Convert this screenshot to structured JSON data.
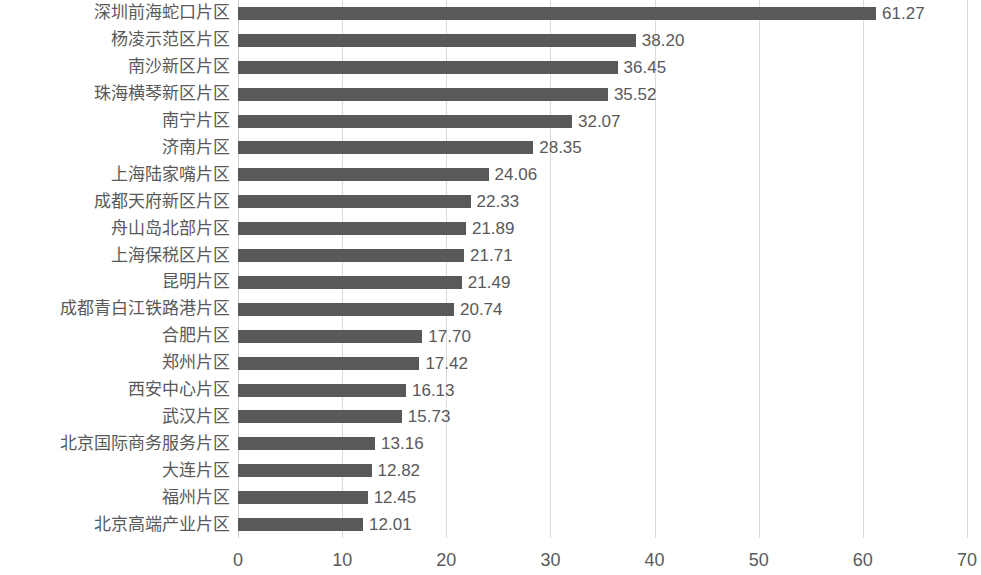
{
  "chart_data": {
    "type": "bar",
    "orientation": "horizontal",
    "title": "",
    "subtitle": "",
    "xlabel": "",
    "ylabel": "",
    "xlim": [
      0,
      70
    ],
    "xticks": [
      "0",
      "10",
      "20",
      "30",
      "40",
      "50",
      "60",
      "70"
    ],
    "grid": "vertical",
    "legend": "none",
    "bar_color": "#595959",
    "gridline_color": "#d9d9d9",
    "text_color": "#595959",
    "background_color": "#ffffff",
    "categories": [
      "深圳前海蛇口片区",
      "杨凌示范区片区",
      "南沙新区片区",
      "珠海横琴新区片区",
      "南宁片区",
      "济南片区",
      "上海陆家嘴片区",
      "成都天府新区片区",
      "舟山岛北部片区",
      "上海保税区片区",
      "昆明片区",
      "成都青白江铁路港片区",
      "合肥片区",
      "郑州片区",
      "西安中心片区",
      "武汉片区",
      "北京国际商务服务片区",
      "大连片区",
      "福州片区",
      "北京高端产业片区"
    ],
    "values": [
      61.27,
      38.2,
      36.45,
      35.52,
      32.07,
      28.35,
      24.06,
      22.33,
      21.89,
      21.71,
      21.49,
      20.74,
      17.7,
      17.42,
      16.13,
      15.73,
      13.16,
      12.82,
      12.45,
      12.01
    ],
    "value_labels": [
      "61.27",
      "38.20",
      "36.45",
      "35.52",
      "32.07",
      "28.35",
      "24.06",
      "22.33",
      "21.89",
      "21.71",
      "21.49",
      "20.74",
      "17.70",
      "17.42",
      "16.13",
      "15.73",
      "13.16",
      "12.82",
      "12.45",
      "12.01"
    ]
  }
}
